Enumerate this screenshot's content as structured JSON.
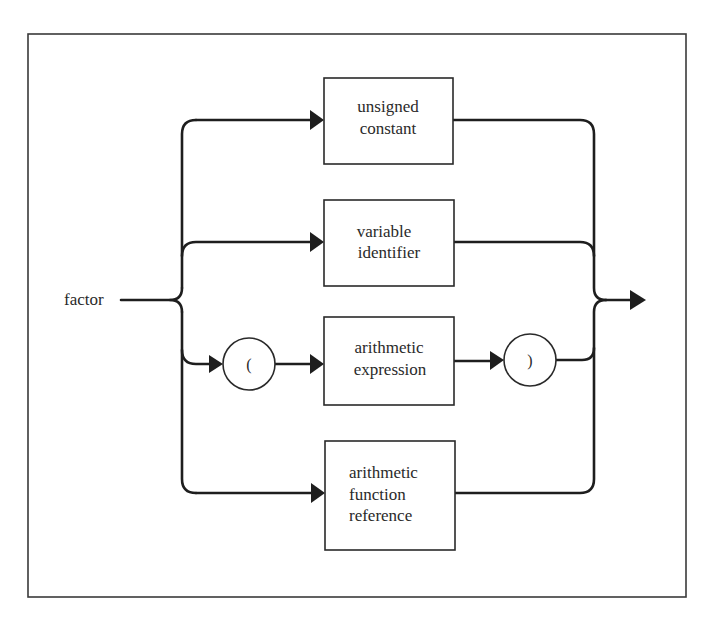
{
  "diagram": {
    "type": "syntax-diagram",
    "entry_label": "factor",
    "alternatives": [
      {
        "kind": "nonterminal",
        "lines": [
          "unsigned",
          "constant"
        ]
      },
      {
        "kind": "nonterminal",
        "lines": [
          "variable",
          "identifier"
        ]
      },
      {
        "kind": "sequence",
        "items": [
          {
            "kind": "terminal",
            "symbol": "("
          },
          {
            "kind": "nonterminal",
            "lines": [
              "arithmetic",
              "expression"
            ]
          },
          {
            "kind": "terminal",
            "symbol": ")"
          }
        ]
      },
      {
        "kind": "nonterminal",
        "lines": [
          "arithmetic",
          "function",
          "reference"
        ]
      }
    ],
    "colors": {
      "line": "#1e1e1e",
      "box_border": "#2a2a2a",
      "background": "#ffffff"
    }
  }
}
